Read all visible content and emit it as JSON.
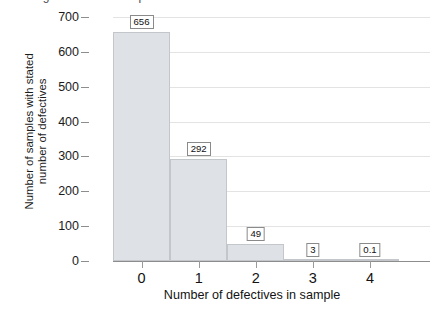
{
  "top_remnant": {
    "text": "ng criterion of sample"
  },
  "chart_data": {
    "type": "bar",
    "title": "",
    "subtitle": "",
    "xlabel": "Number of defectives in sample",
    "ylabel": "Number of samples with stated number of defectives",
    "ylabel_lines": [
      "Number of samples with stated",
      "number of defectives"
    ],
    "categories": [
      "0",
      "1",
      "2",
      "3",
      "4"
    ],
    "values": [
      656,
      292,
      49,
      3,
      0.1
    ],
    "data_labels": [
      "656",
      "292",
      "49",
      "3",
      "0.1"
    ],
    "ylim": [
      0,
      700
    ],
    "yticks": [
      0,
      100,
      200,
      300,
      400,
      500,
      600,
      700
    ],
    "ytick_labels": [
      "0",
      "100",
      "200",
      "300",
      "400",
      "500",
      "600",
      "700"
    ],
    "grid": "horizontal",
    "legend": "none",
    "bar_style": "contiguous-histogram",
    "colors": {
      "bar_fill": "#dee1e6",
      "bar_border": "#c3c6cb",
      "gridline": "#e3e3e3",
      "axis": "#8d8d8d",
      "text": "#111111",
      "background": "#ffffff",
      "label_box_border": "#8a8a8a",
      "label_box_fill": "#ffffff"
    }
  }
}
